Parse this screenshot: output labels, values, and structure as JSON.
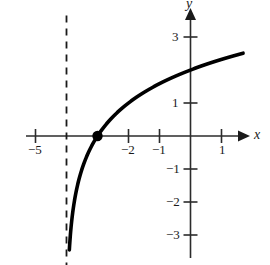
{
  "chart_data": {
    "type": "line",
    "title": "",
    "subtitle": "",
    "xlabel": "x",
    "ylabel": "y",
    "xlim": [
      -5.3,
      2.5
    ],
    "ylim": [
      -3.9,
      3.9
    ],
    "grid": false,
    "legend": null,
    "function": "y = log2(x + 4)",
    "x_ticks": [
      -5,
      -2,
      -1,
      1
    ],
    "x_tick_labels": [
      "−5",
      "−2",
      "−1",
      "1"
    ],
    "y_ticks": [
      3,
      1,
      -1,
      -2,
      -3
    ],
    "y_tick_labels": [
      "3",
      "1",
      "−1",
      "−2",
      "−3"
    ],
    "series": [
      {
        "name": "y = log2(x + 4)",
        "style": "solid",
        "color": "#000000",
        "width": 3.6,
        "points": [
          [
            -3.8,
            -3.45
          ],
          [
            -3.78,
            -3.2
          ],
          [
            -3.76,
            -3.0
          ],
          [
            -3.73,
            -2.75
          ],
          [
            -3.7,
            -2.55
          ],
          [
            -3.65,
            -2.3
          ],
          [
            -3.6,
            -2.1
          ],
          [
            -3.54,
            -1.9
          ],
          [
            -3.48,
            -1.74
          ],
          [
            -3.4,
            -1.54
          ],
          [
            -3.3,
            -1.34
          ],
          [
            -3.2,
            -1.17
          ],
          [
            -3.1,
            -1.0
          ],
          [
            -3.0,
            -0.8
          ],
          [
            -2.9,
            -0.6
          ],
          [
            -2.8,
            -0.42
          ],
          [
            -2.7,
            -0.25
          ],
          [
            -3.0,
            0.0
          ],
          [
            -2.8,
            0.263
          ],
          [
            -2.6,
            0.485
          ],
          [
            -2.4,
            0.678
          ],
          [
            -2.2,
            0.848
          ],
          [
            -2.0,
            1.0
          ],
          [
            -1.8,
            1.138
          ],
          [
            -1.6,
            1.263
          ],
          [
            -1.4,
            1.379
          ],
          [
            -1.2,
            1.485
          ],
          [
            -1.0,
            1.585
          ],
          [
            -0.8,
            1.678
          ],
          [
            -0.6,
            1.766
          ],
          [
            -0.4,
            1.848
          ],
          [
            -0.2,
            1.926
          ],
          [
            0.0,
            2.0
          ],
          [
            0.3,
            2.104
          ],
          [
            0.6,
            2.202
          ],
          [
            0.9,
            2.294
          ],
          [
            1.2,
            2.381
          ],
          [
            1.5,
            2.459
          ],
          [
            1.7,
            2.51
          ]
        ]
      }
    ],
    "asymptote": {
      "name": "vertical-asymptote",
      "x": -4,
      "style": "dashed",
      "color": "#1a1a1a",
      "y_from": -4.0,
      "y_to": 3.65
    },
    "marked_points": [
      {
        "name": "x-intercept",
        "x": -3,
        "y": 0,
        "label": ""
      }
    ]
  }
}
